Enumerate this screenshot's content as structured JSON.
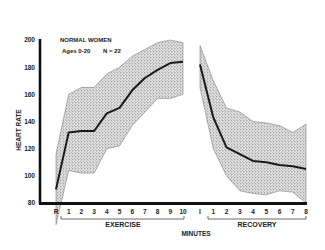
{
  "chart_data": {
    "type": "line",
    "title": "NORMAL WOMEN",
    "subtitle": "Ages 0-20   N = 22",
    "xlabel": "MINUTES",
    "ylabel": "HEART RATE",
    "ylim": [
      80,
      200
    ],
    "yticks": [
      80,
      100,
      120,
      140,
      160,
      180,
      200
    ],
    "grid": false,
    "legend": null,
    "segments": [
      {
        "name": "EXERCISE",
        "categories": [
          "R",
          "1",
          "2",
          "3",
          "4",
          "5",
          "6",
          "7",
          "8",
          "9",
          "10"
        ],
        "series": [
          {
            "name": "mean",
            "values": [
              90,
              132,
              133,
              133,
              146,
              150,
              163,
              172,
              178,
              183,
              184
            ]
          },
          {
            "name": "upper",
            "values": [
              116,
              160,
              165,
              165,
              175,
              180,
              188,
              193,
              198,
              200,
              198
            ]
          },
          {
            "name": "lower",
            "values": [
              64,
              104,
              102,
              102,
              120,
              122,
              137,
              147,
              157,
              157,
              160
            ]
          }
        ]
      },
      {
        "name": "RECOVERY",
        "categories": [
          "I",
          "1",
          "2",
          "3",
          "4",
          "5",
          "6",
          "7",
          "8"
        ],
        "series": [
          {
            "name": "mean",
            "values": [
              182,
              143,
              121,
              116,
              111,
              110,
              108,
              107,
              105
            ]
          },
          {
            "name": "upper",
            "values": [
              196,
              170,
              150,
              147,
              140,
              139,
              137,
              132,
              138
            ]
          },
          {
            "name": "lower",
            "values": [
              165,
              120,
              100,
              89,
              87,
              86,
              89,
              88,
              80
            ]
          }
        ]
      }
    ]
  },
  "labels": {
    "title": "NORMAL WOMEN",
    "subtitle_ages": "Ages 0-20",
    "subtitle_n": "N = 22",
    "ylabel": "HEART RATE",
    "xlabel": "MINUTES",
    "exercise": "EXERCISE",
    "recovery": "RECOVERY"
  },
  "colors": {
    "axis": "#111111",
    "mean_line": "#1a1a1a",
    "band_fill": "#d8d8d8",
    "band_dots": "#555555",
    "band_edge": "#6a6a6a"
  }
}
